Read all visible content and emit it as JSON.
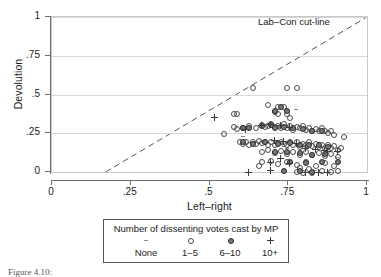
{
  "figure": {
    "ytitle": "Devolution",
    "xtitle": "Left–right",
    "cutline_label": "Lab–Con cut-line"
  },
  "legend": {
    "title": "Number of dissenting votes cast by MP",
    "entries": [
      {
        "label": "None",
        "marker": "dash-marker"
      },
      {
        "label": "1–5",
        "marker": "open-circle-marker"
      },
      {
        "label": "6–10",
        "marker": "filled-circle-marker"
      },
      {
        "label": "10+",
        "marker": "plus-marker"
      }
    ]
  },
  "caption": "Figure 4.10:",
  "colors": {
    "axis": "#6e6e6e",
    "grid": "#d8d8d8",
    "cutline": "#555555",
    "open_marker": "#4a4a4a",
    "filled_marker": "#777777",
    "plus_marker": "#3a3a3a"
  },
  "chart_data": {
    "type": "scatter",
    "title": "",
    "xlabel": "Left–right",
    "ylabel": "Devolution",
    "xlim": [
      0,
      1
    ],
    "ylim": [
      0,
      1
    ],
    "xticks": [
      0,
      0.25,
      0.5,
      0.75,
      1
    ],
    "xticklabels": [
      "0",
      ".25",
      ".5",
      ".75",
      "1"
    ],
    "yticks": [
      0,
      0.25,
      0.5,
      0.75,
      1
    ],
    "yticklabels": [
      "0",
      ".25",
      ".5",
      ".75",
      "1"
    ],
    "grid": "horizontal",
    "legend_position": "below-axes",
    "annotations": [
      {
        "text": "Lab–Con cut-line",
        "x": 0.66,
        "y": 1.0
      }
    ],
    "reference_line": {
      "name": "Lab-Con cut-line",
      "style": "dashed",
      "x0": 0.17,
      "y0": 0.0,
      "x1": 1.0,
      "y1": 1.0
    },
    "series": [
      {
        "name": "None",
        "marker": "dash",
        "points": [
          [
            0.605,
            0.235
          ],
          [
            0.705,
            0.205
          ],
          [
            0.775,
            0.405
          ],
          [
            0.845,
            0.265
          ],
          [
            0.875,
            0.135
          ],
          [
            0.905,
            0.095
          ],
          [
            0.835,
            0.015
          ],
          [
            0.745,
            0.155
          ]
        ]
      },
      {
        "name": "1–5",
        "marker": "open-circle",
        "points": [
          [
            0.635,
            0.545
          ],
          [
            0.745,
            0.545
          ],
          [
            0.775,
            0.545
          ],
          [
            0.685,
            0.435
          ],
          [
            0.715,
            0.425
          ],
          [
            0.735,
            0.425
          ],
          [
            0.575,
            0.375
          ],
          [
            0.585,
            0.38
          ],
          [
            0.705,
            0.39
          ],
          [
            0.715,
            0.375
          ],
          [
            0.745,
            0.375
          ],
          [
            0.755,
            0.35
          ],
          [
            0.545,
            0.25
          ],
          [
            0.575,
            0.295
          ],
          [
            0.585,
            0.28
          ],
          [
            0.605,
            0.29
          ],
          [
            0.625,
            0.3
          ],
          [
            0.645,
            0.285
          ],
          [
            0.665,
            0.305
          ],
          [
            0.675,
            0.295
          ],
          [
            0.685,
            0.3
          ],
          [
            0.695,
            0.31
          ],
          [
            0.705,
            0.295
          ],
          [
            0.715,
            0.3
          ],
          [
            0.725,
            0.285
          ],
          [
            0.735,
            0.31
          ],
          [
            0.745,
            0.29
          ],
          [
            0.755,
            0.3
          ],
          [
            0.765,
            0.275
          ],
          [
            0.775,
            0.295
          ],
          [
            0.785,
            0.285
          ],
          [
            0.795,
            0.3
          ],
          [
            0.805,
            0.275
          ],
          [
            0.815,
            0.285
          ],
          [
            0.825,
            0.27
          ],
          [
            0.835,
            0.28
          ],
          [
            0.845,
            0.265
          ],
          [
            0.855,
            0.285
          ],
          [
            0.865,
            0.27
          ],
          [
            0.875,
            0.255
          ],
          [
            0.885,
            0.265
          ],
          [
            0.895,
            0.24
          ],
          [
            0.925,
            0.23
          ],
          [
            0.595,
            0.195
          ],
          [
            0.605,
            0.185
          ],
          [
            0.615,
            0.195
          ],
          [
            0.625,
            0.175
          ],
          [
            0.635,
            0.195
          ],
          [
            0.645,
            0.185
          ],
          [
            0.655,
            0.205
          ],
          [
            0.665,
            0.19
          ],
          [
            0.675,
            0.2
          ],
          [
            0.685,
            0.18
          ],
          [
            0.695,
            0.195
          ],
          [
            0.705,
            0.175
          ],
          [
            0.715,
            0.19
          ],
          [
            0.725,
            0.2
          ],
          [
            0.735,
            0.185
          ],
          [
            0.745,
            0.175
          ],
          [
            0.755,
            0.195
          ],
          [
            0.765,
            0.18
          ],
          [
            0.775,
            0.2
          ],
          [
            0.785,
            0.165
          ],
          [
            0.795,
            0.185
          ],
          [
            0.805,
            0.175
          ],
          [
            0.815,
            0.195
          ],
          [
            0.825,
            0.17
          ],
          [
            0.835,
            0.185
          ],
          [
            0.845,
            0.165
          ],
          [
            0.855,
            0.18
          ],
          [
            0.865,
            0.155
          ],
          [
            0.875,
            0.175
          ],
          [
            0.885,
            0.16
          ],
          [
            0.895,
            0.17
          ],
          [
            0.905,
            0.145
          ],
          [
            0.915,
            0.16
          ],
          [
            0.665,
            0.13
          ],
          [
            0.685,
            0.145
          ],
          [
            0.705,
            0.125
          ],
          [
            0.725,
            0.14
          ],
          [
            0.745,
            0.12
          ],
          [
            0.765,
            0.135
          ],
          [
            0.785,
            0.115
          ],
          [
            0.805,
            0.13
          ],
          [
            0.825,
            0.11
          ],
          [
            0.845,
            0.125
          ],
          [
            0.865,
            0.105
          ],
          [
            0.885,
            0.12
          ],
          [
            0.905,
            0.1
          ],
          [
            0.665,
            0.065
          ],
          [
            0.695,
            0.075
          ],
          [
            0.715,
            0.055
          ],
          [
            0.745,
            0.07
          ],
          [
            0.775,
            0.05
          ],
          [
            0.805,
            0.065
          ],
          [
            0.835,
            0.045
          ],
          [
            0.865,
            0.06
          ],
          [
            0.895,
            0.04
          ],
          [
            0.655,
            0.04
          ],
          [
            0.785,
            0.03
          ],
          [
            0.815,
            0.02
          ],
          [
            0.855,
            0.01
          ],
          [
            0.885,
            0.005
          ],
          [
            0.905,
            0.01
          ],
          [
            0.775,
            0.005
          ],
          [
            0.795,
            0.0
          ],
          [
            0.825,
            0.0
          ]
        ]
      },
      {
        "name": "6–10",
        "marker": "filled-circle",
        "points": [
          [
            0.725,
            0.425
          ],
          [
            0.705,
            0.4
          ],
          [
            0.745,
            0.395
          ],
          [
            0.605,
            0.29
          ],
          [
            0.625,
            0.285
          ],
          [
            0.665,
            0.3
          ],
          [
            0.695,
            0.305
          ],
          [
            0.705,
            0.29
          ],
          [
            0.735,
            0.295
          ],
          [
            0.765,
            0.29
          ],
          [
            0.795,
            0.28
          ],
          [
            0.825,
            0.265
          ],
          [
            0.855,
            0.27
          ],
          [
            0.605,
            0.195
          ],
          [
            0.635,
            0.185
          ],
          [
            0.675,
            0.195
          ],
          [
            0.715,
            0.185
          ],
          [
            0.755,
            0.19
          ],
          [
            0.785,
            0.18
          ],
          [
            0.815,
            0.175
          ],
          [
            0.845,
            0.18
          ],
          [
            0.875,
            0.165
          ],
          [
            0.705,
            0.13
          ],
          [
            0.745,
            0.135
          ],
          [
            0.785,
            0.125
          ],
          [
            0.825,
            0.115
          ],
          [
            0.865,
            0.12
          ],
          [
            0.755,
            0.065
          ],
          [
            0.805,
            0.06
          ],
          [
            0.855,
            0.07
          ],
          [
            0.905,
            0.065
          ],
          [
            0.785,
            0.01
          ],
          [
            0.825,
            0.005
          ],
          [
            0.735,
            0.01
          ]
        ]
      },
      {
        "name": "10+",
        "marker": "plus",
        "points": [
          [
            0.515,
            0.35
          ],
          [
            0.665,
            0.3
          ],
          [
            0.695,
            0.305
          ],
          [
            0.725,
            0.3
          ],
          [
            0.755,
            0.29
          ],
          [
            0.615,
            0.275
          ],
          [
            0.705,
            0.205
          ],
          [
            0.735,
            0.195
          ],
          [
            0.775,
            0.185
          ],
          [
            0.805,
            0.15
          ],
          [
            0.835,
            0.145
          ],
          [
            0.865,
            0.14
          ],
          [
            0.725,
            0.085
          ],
          [
            0.695,
            0.06
          ],
          [
            0.755,
            0.055
          ],
          [
            0.875,
            0.135
          ],
          [
            0.905,
            0.13
          ],
          [
            0.625,
            -0.005
          ],
          [
            0.695,
            0.01
          ],
          [
            0.805,
            0.0
          ],
          [
            0.845,
            -0.005
          ],
          [
            0.875,
            -0.005
          ]
        ]
      }
    ]
  }
}
